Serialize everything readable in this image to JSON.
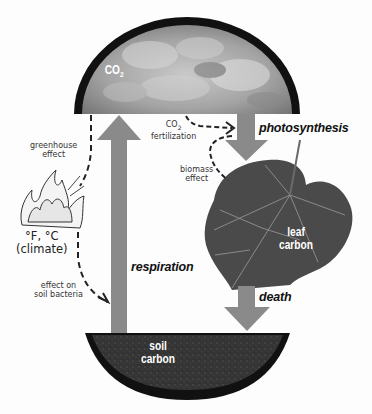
{
  "diagram": {
    "pools": {
      "atmosphere": {
        "label": "CO",
        "subscript": "2"
      },
      "leaf": {
        "line1": "leaf",
        "line2": "carbon"
      },
      "soil": {
        "line1": "soil",
        "line2": "carbon"
      }
    },
    "fluxes": {
      "photosynthesis": "photosynthesis",
      "respiration": "respiration",
      "death": "death"
    },
    "effects": {
      "greenhouse": {
        "line1": "greenhouse",
        "line2": "effect"
      },
      "co2_fertilization": {
        "line1": "CO",
        "line1_sub": "2",
        "line2": "fertilization"
      },
      "biomass": {
        "line1": "biomass",
        "line2": "effect"
      },
      "soil_bacteria": {
        "line1": "effect on",
        "line2": "soil bacteria"
      }
    },
    "climate": {
      "line1": "°F, °C",
      "line2": "(climate)"
    },
    "colors": {
      "arrow_fill": "#8a8a8a",
      "pool_rim": "#111111",
      "sky": "#9a9a9a",
      "soil": "#2e2e2e",
      "leaf": "#4a4a4a",
      "dashed": "#222222"
    }
  }
}
